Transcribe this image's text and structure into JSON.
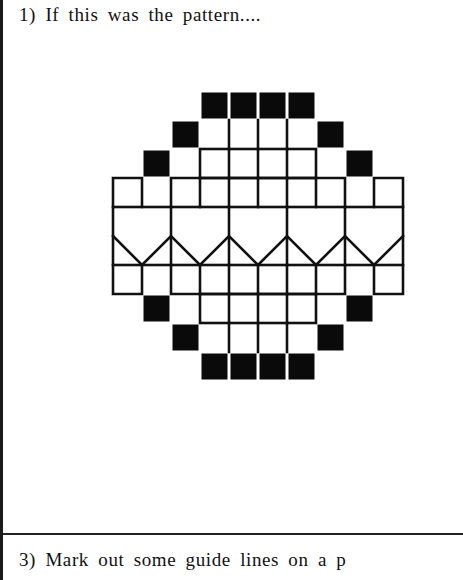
{
  "steps": [
    {
      "label": "1) If this was the pattern...."
    },
    {
      "label": "3) Mark out some guide lines on a p"
    }
  ],
  "pattern": {
    "description": "Symmetrical octagonal grid motif with black filled squares around the rim, outlined grid cells, and a zigzag (chevron) band across the middle",
    "cell_size_px": 29,
    "grid_origin": [
      113,
      91
    ],
    "columns": 10,
    "rows": 10,
    "filled_cells": [
      [
        3,
        0
      ],
      [
        4,
        0
      ],
      [
        5,
        0
      ],
      [
        6,
        0
      ],
      [
        2,
        1
      ],
      [
        7,
        1
      ],
      [
        1,
        2
      ],
      [
        8,
        2
      ],
      [
        1,
        7
      ],
      [
        8,
        7
      ],
      [
        2,
        8
      ],
      [
        7,
        8
      ],
      [
        3,
        9
      ],
      [
        4,
        9
      ],
      [
        5,
        9
      ],
      [
        6,
        9
      ]
    ],
    "colors": {
      "fill": "#0a0a0a",
      "line": "#111111",
      "background": "#ffffff"
    }
  }
}
